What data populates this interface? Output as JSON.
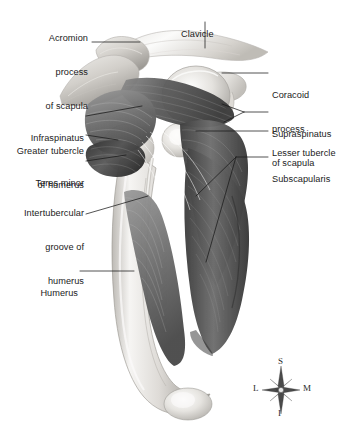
{
  "figure": {
    "background_color": "#ffffff",
    "width": 356,
    "height": 435
  },
  "labels": {
    "acromion": {
      "line1": "Acromion",
      "line2": "process",
      "line3": "of scapula"
    },
    "clavicle": {
      "line1": "Clavicle"
    },
    "coracoid": {
      "line1": "Coracoid",
      "line2": "process",
      "line3": "of scapula"
    },
    "supraspinatus": {
      "line1": "Supraspinatus"
    },
    "lesser_tubercle": {
      "line1": "Lesser tubercle"
    },
    "subscapularis": {
      "line1": "Subscapularis"
    },
    "infraspinatus": {
      "line1": "Infraspinatus"
    },
    "greater_tubercle": {
      "line1": "Greater tubercle",
      "line2": "of humerus"
    },
    "teres_minor": {
      "line1": "Teres minor"
    },
    "intertubercular": {
      "line1": "Intertubercular",
      "line2": "groove of",
      "line3": "humerus"
    },
    "humerus": {
      "line1": "Humerus"
    }
  },
  "compass": {
    "superior": "S",
    "inferior": "I",
    "lateral": "L",
    "medial": "M"
  },
  "colors": {
    "text": "#1b1b1b",
    "leader_line": "#1a1a1a",
    "bone_light": "#f2f1ef",
    "bone_mid": "#d8d6d2",
    "bone_shadow": "#a9a6a1",
    "muscle_dark": "#4a4a4a",
    "muscle_mid": "#7b7b7b",
    "muscle_light": "#b5b5b5",
    "compass": "#2a2a2a"
  }
}
